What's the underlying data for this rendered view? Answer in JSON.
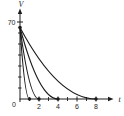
{
  "figure": {
    "description_label": "discharge curves figure"
  },
  "colors": {
    "ink": "#1c1c1c",
    "background": "#ffffff"
  },
  "chart_data": {
    "type": "line",
    "title": "",
    "xlabel": "t",
    "ylabel": "V",
    "xlim": [
      0,
      9.9
    ],
    "ylim": [
      0,
      78
    ],
    "grid": false,
    "legend": false,
    "origin_label": "0",
    "x_tick_labels": [
      2,
      4,
      6,
      8
    ],
    "x_minor_ticks": [
      1,
      3,
      5,
      7
    ],
    "y_tick_labels": [
      70
    ],
    "y_minor_ticks": [
      10,
      20,
      30,
      40,
      50,
      60
    ],
    "start_point": {
      "t": 0,
      "V": 65
    },
    "curve_model": "V(t) = 65*(1 - t/T)^2 for t <= T, reaching V = 0 at t = T",
    "series": [
      {
        "name": "curve-T1",
        "T": 1,
        "points": [
          [
            0,
            65
          ],
          [
            0.25,
            37
          ],
          [
            0.5,
            16
          ],
          [
            0.75,
            4
          ],
          [
            1,
            0
          ]
        ]
      },
      {
        "name": "curve-T2",
        "T": 2,
        "points": [
          [
            0,
            65
          ],
          [
            0.5,
            37
          ],
          [
            1,
            16
          ],
          [
            1.5,
            4
          ],
          [
            2,
            0
          ]
        ]
      },
      {
        "name": "curve-T4",
        "T": 4,
        "points": [
          [
            0,
            65
          ],
          [
            1,
            37
          ],
          [
            2,
            16
          ],
          [
            3,
            4
          ],
          [
            4,
            0
          ]
        ]
      },
      {
        "name": "curve-T8",
        "T": 8,
        "points": [
          [
            0,
            65
          ],
          [
            2,
            37
          ],
          [
            4,
            16
          ],
          [
            6,
            4
          ],
          [
            8,
            0
          ]
        ]
      }
    ],
    "zero_crossing_dots_t": [
      1,
      2,
      4,
      8
    ]
  }
}
